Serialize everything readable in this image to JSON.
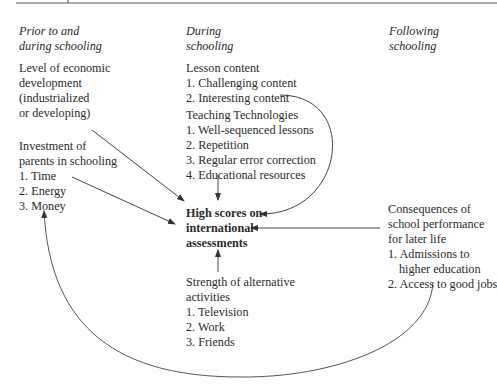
{
  "columns": {
    "prior": {
      "heading": [
        "Prior to and",
        "during schooling"
      ]
    },
    "during": {
      "heading": [
        "During",
        "schooling"
      ]
    },
    "following": {
      "heading": [
        "Following",
        "schooling"
      ]
    }
  },
  "nodes": {
    "economic": {
      "lines": [
        "Level of economic",
        "development",
        "(industrialized",
        "or developing)"
      ]
    },
    "parents": {
      "title": [
        "Investment of",
        "parents in schooling"
      ],
      "items": [
        "1. Time",
        "2. Energy",
        "3. Money"
      ]
    },
    "lesson": {
      "title": "Lesson content",
      "items": [
        "1. Challenging content",
        "2. Interesting content"
      ]
    },
    "teaching": {
      "title": "Teaching Technologies",
      "items": [
        "1. Well-sequenced lessons",
        "2. Repetition",
        "3. Regular error correction",
        "4. Educational resources"
      ]
    },
    "outcome": {
      "lines": [
        "High scores on",
        "international",
        "assessments"
      ]
    },
    "alternative": {
      "title": [
        "Strength of alternative",
        "activities"
      ],
      "items": [
        "1. Television",
        "2. Work",
        "3. Friends"
      ]
    },
    "consequences": {
      "title": [
        "Consequences of",
        "school performance",
        "for later life"
      ],
      "items": [
        "1. Admissions to",
        "higher education",
        "2. Access to good jobs"
      ]
    }
  },
  "colors": {
    "text": "#2a2a2a",
    "line": "#444444",
    "rule": "#555555"
  }
}
